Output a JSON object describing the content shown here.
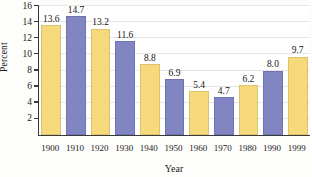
{
  "chart_data": {
    "type": "bar",
    "title": "",
    "xlabel": "Year",
    "ylabel": "Percent",
    "categories": [
      "1900",
      "1910",
      "1920",
      "1930",
      "1940",
      "1950",
      "1960",
      "1970",
      "1980",
      "1990",
      "1999"
    ],
    "values": [
      13.6,
      14.7,
      13.2,
      11.6,
      8.8,
      6.9,
      5.4,
      4.7,
      6.2,
      8.0,
      9.7
    ],
    "value_labels": [
      "13.6",
      "14.7",
      "13.2",
      "11.6",
      "8.8",
      "6.9",
      "5.4",
      "4.7",
      "6.2",
      "8.0",
      "9.7"
    ],
    "bar_colors": [
      "#f5d97a",
      "#8186c2",
      "#f5d97a",
      "#8186c2",
      "#f5d97a",
      "#8186c2",
      "#f5d97a",
      "#8186c2",
      "#f5d97a",
      "#8186c2",
      "#f5d97a"
    ],
    "ylim": [
      0,
      16
    ],
    "ytick_labels": [
      "2",
      "4",
      "6",
      "8",
      "10",
      "12",
      "14",
      "16"
    ],
    "ytick_values": [
      2,
      4,
      6,
      8,
      10,
      12,
      14,
      16
    ],
    "grid": true,
    "legend": null,
    "colors": {
      "series_a": "#f5d97a",
      "series_b": "#8186c2",
      "axis": "#3a3a3a",
      "grid": "#e6e6e6",
      "text": "#1a1a1a",
      "background": "#ffffff"
    }
  }
}
